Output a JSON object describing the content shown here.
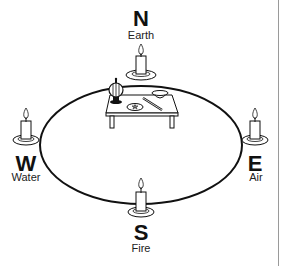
{
  "diagram": {
    "title": "",
    "directions": {
      "north": {
        "letter": "N",
        "element": "Earth"
      },
      "south": {
        "letter": "S",
        "element": "Fire"
      },
      "east": {
        "letter": "E",
        "element": "Air"
      },
      "west": {
        "letter": "W",
        "element": "Water"
      }
    },
    "icons": {
      "candle": "candle-icon",
      "altar": "altar-table-icon",
      "censer": "censer-icon",
      "bowl": "bowl-icon",
      "pentacle": "pentacle-plate-icon",
      "wand": "wand-icon",
      "circle": "ritual-circle"
    },
    "colors": {
      "line": "#111111",
      "background": "#ffffff",
      "divider": "#9a9a9a"
    }
  }
}
